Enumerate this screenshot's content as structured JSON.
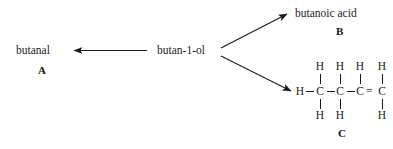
{
  "diagram": {
    "type": "reaction-scheme",
    "background_color": "#ffffff",
    "line_color": "#1a1a1a",
    "reactant": {
      "name": "butan-1-ol"
    },
    "products": [
      {
        "id": "A",
        "name": "butanal",
        "tag": "A",
        "direction": "left"
      },
      {
        "id": "B",
        "name": "butanoic acid",
        "tag": "B",
        "direction": "up-right"
      },
      {
        "id": "C",
        "name": "",
        "tag": "C",
        "direction": "down-right",
        "structure": {
          "type": "displayed-formula",
          "backbone": [
            "C",
            "C",
            "C",
            "C"
          ],
          "terminal_left_hydrogen": "H",
          "top_hydrogens": [
            "H",
            "H",
            "H",
            "H"
          ],
          "bottom_hydrogens": [
            "H",
            "H",
            "H"
          ],
          "backbone_bonds": [
            "single",
            "single",
            "double"
          ],
          "double_bond_glyph": "="
        }
      }
    ],
    "arrows": [
      {
        "name": "arrow-to-butanal",
        "head": "left"
      },
      {
        "name": "arrow-to-butanoic-acid",
        "head": "up-right"
      },
      {
        "name": "arrow-to-structure-c",
        "head": "down-right"
      }
    ]
  }
}
